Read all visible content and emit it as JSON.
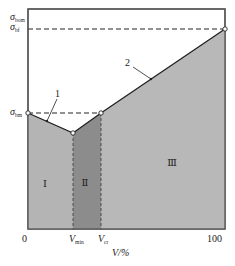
{
  "diagram": {
    "y_labels": {
      "sigma_bom": {
        "main": "σ",
        "sub": "bom"
      },
      "sigma_bf": {
        "main": "σ",
        "sub": "bf"
      },
      "sigma_bm": {
        "main": "σ",
        "sub": "bm"
      }
    },
    "x_labels": {
      "zero": "0",
      "v_min": {
        "main": "V",
        "sub": "min"
      },
      "v_cr": {
        "main": "V",
        "sub": "cr"
      },
      "hundred": "100",
      "axis_title": "V/%"
    },
    "regions": {
      "region_1": "Ⅰ",
      "region_2": "Ⅱ",
      "region_3": "Ⅲ"
    },
    "callouts": {
      "line_1": "1",
      "line_2": "2"
    },
    "colors": {
      "region_1_fill": "#b4b4b4",
      "region_2_fill": "#8c8c8c",
      "region_3_fill": "#b8b8b8",
      "line": "#333333",
      "frame": "#555555"
    }
  }
}
